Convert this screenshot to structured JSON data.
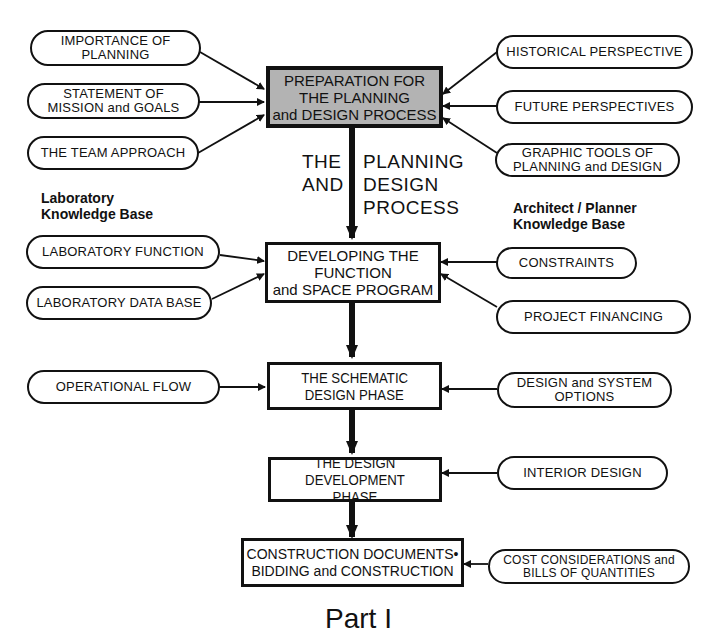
{
  "title": {
    "center_left": [
      "THE",
      "AND"
    ],
    "center_right": [
      "PLANNING",
      "DESIGN",
      "PROCESS"
    ]
  },
  "knowledge_bases": {
    "left": [
      "Laboratory",
      "Knowledge Base"
    ],
    "right": [
      "Architect / Planner",
      "Knowledge Base"
    ]
  },
  "main_steps": [
    {
      "lines": [
        "PREPARATION FOR",
        "THE PLANNING",
        "and DESIGN PROCESS"
      ],
      "highlight": true
    },
    {
      "lines": [
        "DEVELOPING THE",
        "FUNCTION",
        "and SPACE PROGRAM"
      ]
    },
    {
      "lines": [
        "THE SCHEMATIC",
        "DESIGN PHASE"
      ]
    },
    {
      "lines": [
        "THE DESIGN",
        "DEVELOPMENT PHASE"
      ]
    },
    {
      "lines": [
        "CONSTRUCTION DOCUMENTS•",
        "BIDDING and CONSTRUCTION"
      ]
    }
  ],
  "left_inputs": [
    {
      "lines": [
        "IMPORTANCE OF",
        "PLANNING"
      ],
      "target": 0
    },
    {
      "lines": [
        "STATEMENT OF",
        "MISSION and GOALS"
      ],
      "target": 0
    },
    {
      "lines": [
        "THE TEAM APPROACH"
      ],
      "target": 0
    },
    {
      "lines": [
        "LABORATORY FUNCTION"
      ],
      "target": 1
    },
    {
      "lines": [
        "LABORATORY DATA BASE"
      ],
      "target": 1
    },
    {
      "lines": [
        "OPERATIONAL FLOW"
      ],
      "target": 2
    }
  ],
  "right_inputs": [
    {
      "lines": [
        "HISTORICAL PERSPECTIVE"
      ],
      "target": 0
    },
    {
      "lines": [
        "FUTURE PERSPECTIVES"
      ],
      "target": 0
    },
    {
      "lines": [
        "GRAPHIC TOOLS OF",
        "PLANNING and DESIGN"
      ],
      "target": 0
    },
    {
      "lines": [
        "CONSTRAINTS"
      ],
      "target": 1
    },
    {
      "lines": [
        "PROJECT FINANCING"
      ],
      "target": 1
    },
    {
      "lines": [
        "DESIGN and SYSTEM",
        "OPTIONS"
      ],
      "target": 2
    },
    {
      "lines": [
        "INTERIOR DESIGN"
      ],
      "target": 3
    },
    {
      "lines": [
        "COST CONSIDERATIONS and",
        "BILLS OF QUANTITIES"
      ],
      "target": 4
    }
  ],
  "footer": {
    "part_label": "Part I"
  },
  "colors": {
    "highlight_fill": "#b3b3b3",
    "stroke": "#111111"
  }
}
